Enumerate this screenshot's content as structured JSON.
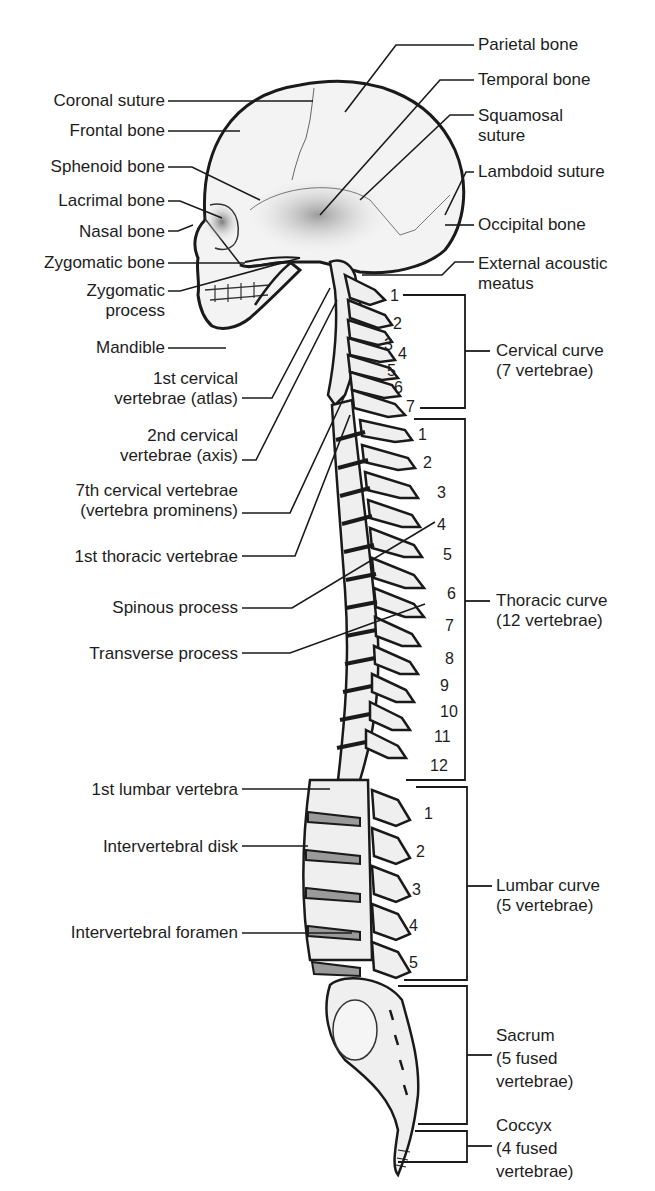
{
  "skull_labels_left": {
    "coronal_suture": "Coronal suture",
    "frontal_bone": "Frontal bone",
    "sphenoid_bone": "Sphenoid bone",
    "lacrimal_bone": "Lacrimal bone",
    "nasal_bone": "Nasal bone",
    "zygomatic_bone": "Zygomatic bone",
    "zygomatic_process_1": "Zygomatic",
    "zygomatic_process_2": "process",
    "mandible": "Mandible"
  },
  "skull_labels_right": {
    "parietal_bone": "Parietal bone",
    "temporal_bone": "Temporal bone",
    "squamosal_suture_1": "Squamosal",
    "squamosal_suture_2": "suture",
    "lambdoid_suture": "Lambdoid suture",
    "occipital_bone": "Occipital bone",
    "external_acoustic_meatus_1": "External acoustic",
    "external_acoustic_meatus_2": "meatus"
  },
  "spine_labels_left": {
    "atlas_1": "1st cervical",
    "atlas_2": "vertebrae (atlas)",
    "axis_1": "2nd cervical",
    "axis_2": "vertebrae (axis)",
    "c7_1": "7th cervical vertebrae",
    "c7_2": "(vertebra prominens)",
    "t1": "1st thoracic vertebrae",
    "spinous_process": "Spinous process",
    "transverse_process": "Transverse process",
    "l1": "1st lumbar vertebra",
    "intervertebral_disk": "Intervertebral disk",
    "intervertebral_foramen": "Intervertebral foramen"
  },
  "regions": {
    "cervical": {
      "name": "Cervical curve",
      "count": "(7 vertebrae)",
      "numbers": [
        "1",
        "2",
        "3",
        "4",
        "5",
        "6",
        "7"
      ]
    },
    "thoracic": {
      "name": "Thoracic curve",
      "count": "(12 vertebrae)",
      "numbers": [
        "1",
        "2",
        "3",
        "4",
        "5",
        "6",
        "7",
        "8",
        "9",
        "10",
        "11",
        "12"
      ]
    },
    "lumbar": {
      "name": "Lumbar curve",
      "count": "(5 vertebrae)",
      "numbers": [
        "1",
        "2",
        "3",
        "4",
        "5"
      ]
    },
    "sacrum": {
      "name": "Sacrum",
      "count_1": "(5 fused",
      "count_2": "vertebrae)"
    },
    "coccyx": {
      "name": "Coccyx",
      "count_1": "(4 fused",
      "count_2": "vertebrae)"
    }
  },
  "colors": {
    "line": "#1a1a1a",
    "bone": "#f1f1f1",
    "bone_shade": "#c9c9c9",
    "disk": "#9a9a9a"
  }
}
